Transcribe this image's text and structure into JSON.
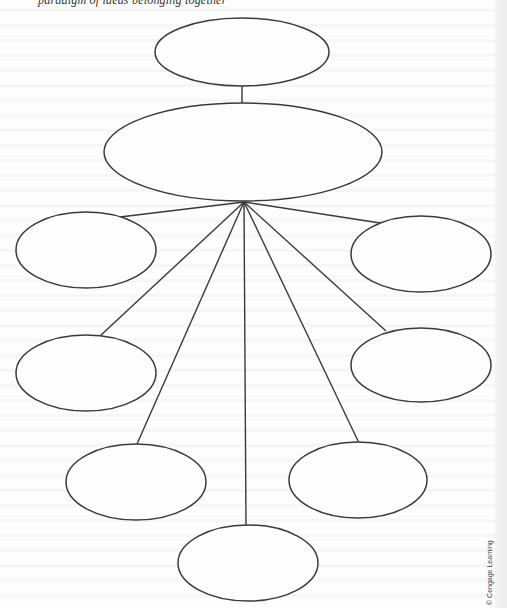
{
  "header": {
    "partial_text": "paradigm of ideas belonging together"
  },
  "diagram": {
    "type": "hierarchical cluster / web organizer",
    "stroke_color": "#3a3a3a",
    "background_color": "#fdfdfd",
    "nodes": [
      {
        "id": "top",
        "label": "",
        "cx": 242,
        "cy": 52,
        "rx": 87,
        "ry": 34
      },
      {
        "id": "center",
        "label": "",
        "cx": 243,
        "cy": 152,
        "rx": 139,
        "ry": 49
      },
      {
        "id": "left-upper",
        "label": "",
        "cx": 86,
        "cy": 250,
        "rx": 70,
        "ry": 38
      },
      {
        "id": "right-upper",
        "label": "",
        "cx": 421,
        "cy": 254,
        "rx": 70,
        "ry": 38
      },
      {
        "id": "left-middle",
        "label": "",
        "cx": 86,
        "cy": 373,
        "rx": 70,
        "ry": 38
      },
      {
        "id": "right-middle",
        "label": "",
        "cx": 421,
        "cy": 365,
        "rx": 70,
        "ry": 37
      },
      {
        "id": "left-lower",
        "label": "",
        "cx": 136,
        "cy": 482,
        "rx": 70,
        "ry": 38
      },
      {
        "id": "right-lower",
        "label": "",
        "cx": 358,
        "cy": 480,
        "rx": 69,
        "ry": 38
      },
      {
        "id": "bottom",
        "label": "",
        "cx": 248,
        "cy": 563,
        "rx": 70,
        "ry": 38
      }
    ],
    "hub": {
      "x": 244,
      "y": 202
    },
    "edges": [
      {
        "from": "top",
        "to": "center",
        "x1": 242,
        "y1": 86,
        "x2": 242,
        "y2": 103
      },
      {
        "from": "center",
        "to": "left-upper",
        "x1": 244,
        "y1": 202,
        "x2": 120,
        "y2": 217
      },
      {
        "from": "center",
        "to": "right-upper",
        "x1": 244,
        "y1": 202,
        "x2": 380,
        "y2": 223
      },
      {
        "from": "center",
        "to": "left-middle",
        "x1": 244,
        "y1": 202,
        "x2": 100,
        "y2": 336
      },
      {
        "from": "center",
        "to": "right-middle",
        "x1": 244,
        "y1": 202,
        "x2": 386,
        "y2": 331
      },
      {
        "from": "center",
        "to": "left-lower",
        "x1": 244,
        "y1": 202,
        "x2": 137,
        "y2": 444
      },
      {
        "from": "center",
        "to": "right-lower",
        "x1": 244,
        "y1": 202,
        "x2": 359,
        "y2": 443
      },
      {
        "from": "center",
        "to": "bottom",
        "x1": 244,
        "y1": 202,
        "x2": 246,
        "y2": 525
      }
    ]
  },
  "credit": "© Cengage Learning"
}
